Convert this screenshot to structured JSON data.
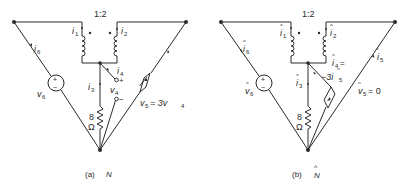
{
  "figure": {
    "left": {
      "caption_prefix": "(a)",
      "caption_name": "N",
      "turns_ratio": "1:2",
      "labels": {
        "i1": "i",
        "i1_sub": "1",
        "i2": "i",
        "i2_sub": "2",
        "i3": "i",
        "i3_sub": "3",
        "i4": "i",
        "i4_sub": "4",
        "i6": "i",
        "i6_sub": "6",
        "v4": "v",
        "v4_sub": "4",
        "v6": "v",
        "v6_sub": "6",
        "v4_plus": "+",
        "v4_minus": "−",
        "src_plus": "+",
        "src_minus": "−",
        "resistor_value": "8",
        "resistor_unit": "Ω",
        "dep_source_eq_lhs": "v",
        "dep_source_eq_lhs_sub": "5",
        "dep_source_eq_rhs": "= 3v",
        "dep_source_eq_rhs_sub": "4"
      }
    },
    "right": {
      "caption_prefix": "(b)",
      "caption_name": "N",
      "caption_hat": "^",
      "turns_ratio": "1:2",
      "labels": {
        "i1": "i",
        "i1_sub": "1",
        "i2": "i",
        "i2_sub": "2",
        "i3": "i",
        "i3_sub": "3",
        "i4": "i",
        "i4_sub": "4",
        "i4_eq": "=",
        "i4_value": "−3i",
        "i4_value_sub": "5",
        "i5": "i",
        "i5_sub": "5",
        "i6": "i",
        "i6_sub": "6",
        "v5": "v",
        "v5_sub": "5",
        "v5_value": "= 0",
        "v6": "v",
        "v6_sub": "6",
        "src_plus": "+",
        "src_minus": "−",
        "resistor_value": "8",
        "resistor_unit": "Ω",
        "hat": "^"
      }
    }
  }
}
